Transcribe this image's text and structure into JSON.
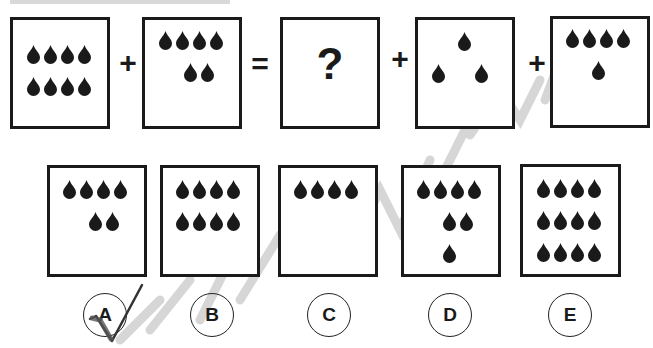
{
  "puzzle": {
    "equation": {
      "operators": [
        "+",
        "=",
        "+",
        "+"
      ],
      "unknown_symbol": "?",
      "panels": [
        {
          "id": "term1",
          "drop_rows": [
            4,
            4
          ]
        },
        {
          "id": "term2",
          "drop_rows": [
            4,
            2
          ]
        },
        {
          "id": "result",
          "unknown": true
        },
        {
          "id": "term3",
          "drop_rows": [
            1,
            2
          ]
        },
        {
          "id": "term4",
          "drop_rows": [
            4,
            1
          ]
        }
      ]
    },
    "options": [
      {
        "label": "A",
        "drop_rows": [
          4,
          2
        ],
        "checked": true
      },
      {
        "label": "B",
        "drop_rows": [
          4,
          4
        ],
        "checked": false
      },
      {
        "label": "C",
        "drop_rows": [
          4
        ],
        "checked": false
      },
      {
        "label": "D",
        "drop_rows": [
          4,
          2,
          1
        ],
        "checked": false
      },
      {
        "label": "E",
        "drop_rows": [
          4,
          4,
          4
        ],
        "checked": false
      }
    ],
    "colors": {
      "ink": "#1a1a1a",
      "watermark": "#c8c8c8",
      "background": "#ffffff"
    }
  }
}
